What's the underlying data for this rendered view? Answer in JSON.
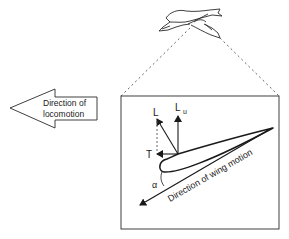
{
  "diagram": {
    "locomotion_arrow": {
      "line1": "Direction of",
      "line2": "locomotion"
    },
    "forces": {
      "lift": "L",
      "lift_upward": "L",
      "lift_upward_subscript": "u",
      "thrust": "T",
      "angle_of_attack": "α"
    },
    "wing_motion_label": "Direction of wing motion",
    "colors": {
      "stroke": "#1a1a1a",
      "dashed": "#555555",
      "background": "#ffffff"
    }
  }
}
